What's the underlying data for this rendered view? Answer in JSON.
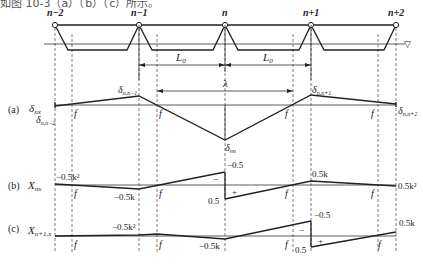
{
  "heading_fragment": "如图 10-3（a）（b）（c）所示。",
  "nodes": [
    "n−2",
    "n−1",
    "n",
    "n+1",
    "n+2"
  ],
  "spans": {
    "left": "L",
    "right": "L",
    "sub": "0"
  },
  "lambda": "λ",
  "water_symbol": "▽",
  "panels": {
    "a": {
      "label": "(a)",
      "ordinate": "δ",
      "ordinate_sub": "nx",
      "values": {
        "n_nm2": {
          "main": "δ",
          "sub": "n,n−2"
        },
        "n_nm1": {
          "main": "δ",
          "sub": "n,n−1"
        },
        "nn": {
          "main": "δ",
          "sub": "nn"
        },
        "n_np1": {
          "main": "δ",
          "sub": "n,n+1"
        },
        "n_np2": {
          "main": "δ",
          "sub": "n,n+2"
        }
      },
      "f_labels": [
        "f",
        "f",
        "f",
        "f"
      ]
    },
    "b": {
      "label": "(b)",
      "ordinate": "X",
      "ordinate_sub": "nx",
      "values": {
        "left_end": "−0.5k²",
        "at_nm1": "−0.5k",
        "at_n_top": "−0.5",
        "at_n_bottom": "0.5",
        "at_np1": "0.5k",
        "right_end": "0.5k²"
      },
      "signs": {
        "minus": "−",
        "plus": "+"
      },
      "f_labels": [
        "f",
        "f",
        "f",
        "f"
      ]
    },
    "c": {
      "label": "(c)",
      "ordinate": "X",
      "ordinate_sub": "n+1,x",
      "values": {
        "at_nm1": "−0.5k²",
        "at_n": "−0.5k",
        "at_np1_top": "−0.5",
        "at_np1_bottom": "0.5",
        "right_end": "0.5k"
      },
      "signs": {
        "minus": "−",
        "plus": "+"
      },
      "f_labels": [
        "f",
        "f",
        "f",
        "f"
      ]
    }
  }
}
